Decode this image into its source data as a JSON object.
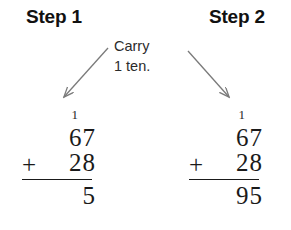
{
  "headings": {
    "step1": "Step 1",
    "step2": "Step 2"
  },
  "caption": {
    "line1": "Carry",
    "line2": "1 ten."
  },
  "colors": {
    "background": "#ffffff",
    "text": "#1a1a1a",
    "heading": "#111111",
    "arrow": "#7a7a7a",
    "rule": "#1a1a1a"
  },
  "problem": {
    "left": {
      "carry": "1",
      "addend1": "67",
      "operator": "+",
      "addend2": "28",
      "total": "5"
    },
    "right": {
      "carry": "1",
      "addend1": "67",
      "operator": "+",
      "addend2": "28",
      "total": "95"
    }
  },
  "arrows": {
    "left": "arrow-down-left",
    "right": "arrow-down-right"
  }
}
